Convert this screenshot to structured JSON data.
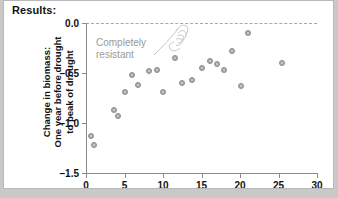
{
  "figure": {
    "title": "Results:",
    "annotation": "Completely\nresistant",
    "hand_icon": "pointing-hand-sketch-icon"
  },
  "colors": {
    "marker": "#a6a6a6",
    "marker_edge": "#8f8f8f",
    "axis": "#8a8a8a",
    "zero_line": "#a8a8a8",
    "annotation_text": "#9a9a9a",
    "panel_background": "#ffffff",
    "page_background": "#c9c9c9"
  },
  "chart_data": {
    "type": "scatter",
    "title": "Results:",
    "xlabel": "Number of plant species before drought",
    "ylabel": "Change in biomass: One year before drought to peak of drought",
    "ylabel_lines": [
      "Change in biomass:",
      "One year before drought",
      "to peak of drought"
    ],
    "xlim": [
      0,
      30
    ],
    "ylim": [
      -1.5,
      0.0
    ],
    "xticks": [
      0,
      5,
      10,
      15,
      20,
      25,
      30
    ],
    "yticks": [
      0.0,
      -0.5,
      -1.0,
      -1.5
    ],
    "xtick_labels": [
      "0",
      "5",
      "10",
      "15",
      "20",
      "25",
      "30"
    ],
    "ytick_labels": [
      "0.0",
      "-0.5",
      "-1.0",
      "-1.5"
    ],
    "grid": false,
    "legend": null,
    "reference_lines": [
      {
        "axis": "y",
        "value": 0.0,
        "style": "dashed",
        "label": "Completely resistant"
      }
    ],
    "annotations": [
      {
        "text": "Completely resistant",
        "x": 2.0,
        "y": -0.22
      }
    ],
    "points": [
      {
        "x": 0.6,
        "y": -1.13
      },
      {
        "x": 1.1,
        "y": -1.22
      },
      {
        "x": 3.6,
        "y": -0.87
      },
      {
        "x": 4.2,
        "y": -0.93
      },
      {
        "x": 5.0,
        "y": -0.69
      },
      {
        "x": 6.0,
        "y": -0.52
      },
      {
        "x": 6.7,
        "y": -0.62
      },
      {
        "x": 8.2,
        "y": -0.48
      },
      {
        "x": 9.2,
        "y": -0.47
      },
      {
        "x": 10.0,
        "y": -0.69
      },
      {
        "x": 11.5,
        "y": -0.35
      },
      {
        "x": 12.5,
        "y": -0.6
      },
      {
        "x": 13.8,
        "y": -0.57
      },
      {
        "x": 15.1,
        "y": -0.45
      },
      {
        "x": 16.1,
        "y": -0.38
      },
      {
        "x": 17.0,
        "y": -0.41
      },
      {
        "x": 17.9,
        "y": -0.47
      },
      {
        "x": 19.0,
        "y": -0.28
      },
      {
        "x": 20.1,
        "y": -0.63
      },
      {
        "x": 21.0,
        "y": -0.1
      },
      {
        "x": 25.5,
        "y": -0.4
      }
    ]
  }
}
